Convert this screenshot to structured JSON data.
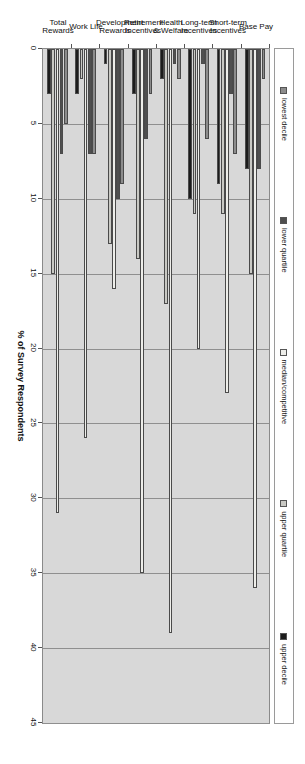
{
  "chart_data": {
    "type": "bar",
    "orientation": "horizontal-grouped",
    "title": "",
    "xlabel": "% of Survey Respondents",
    "ylabel": "",
    "xlim": [
      0,
      45
    ],
    "xticks": [
      0,
      5,
      10,
      15,
      20,
      25,
      30,
      35,
      40,
      45
    ],
    "grid": true,
    "legend_position": "top",
    "categories": [
      "Base Pay",
      "Short-term Incentives",
      "Long-term Incentives",
      "Health & Welfare",
      "Retirement Incentives",
      "Development Rewards",
      "Work Life",
      "Total Rewards"
    ],
    "series": [
      {
        "name": "lowest decile",
        "color": "#8c8c8c",
        "values": [
          2,
          7,
          6,
          2,
          3,
          9,
          7,
          5
        ]
      },
      {
        "name": "lower quartile",
        "color": "#4f4f4f",
        "values": [
          8,
          3,
          1,
          1,
          6,
          10,
          7,
          7
        ]
      },
      {
        "name": "median/competitive",
        "color": "#eeeeea",
        "values": [
          36,
          23,
          20,
          39,
          35,
          16,
          26,
          31
        ]
      },
      {
        "name": "upper quartile",
        "color": "#c9c9c4",
        "values": [
          15,
          11,
          11,
          17,
          14,
          13,
          2,
          15
        ]
      },
      {
        "name": "upper decile",
        "color": "#1c1c1c",
        "values": [
          8,
          9,
          10,
          2,
          3,
          1,
          3,
          3
        ]
      }
    ]
  },
  "axis": {
    "value_axis_title": "% of Survey Respondents",
    "tick_labels": [
      "45",
      "40",
      "35",
      "30",
      "25",
      "20",
      "15",
      "10",
      "5",
      "0"
    ]
  },
  "legend": {
    "items": [
      {
        "label": "lowest decile",
        "swatch": "#8c8c8c"
      },
      {
        "label": "lower quartile",
        "swatch": "#4f4f4f"
      },
      {
        "label": "median/competitive",
        "swatch": "#eeeeea"
      },
      {
        "label": "upper quartile",
        "swatch": "#c9c9c4"
      },
      {
        "label": "upper decile",
        "swatch": "#1c1c1c"
      }
    ]
  },
  "colors": {
    "plot_background": "#d8d8d8",
    "gridline": "#8f8f8f",
    "page_background": "#ffffff",
    "text": "#111111"
  }
}
